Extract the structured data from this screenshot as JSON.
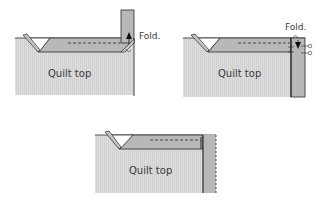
{
  "colors": {
    "quilt": "#d9d9d9",
    "binding": "#b8b8b8",
    "line": "#2a2a2a",
    "background": "#ffffff"
  },
  "panels": [
    {
      "id": "step1",
      "quilt_label": "Quilt top",
      "fold_label": "Fold.",
      "arrow": "up"
    },
    {
      "id": "step2",
      "quilt_label": "Quilt top",
      "fold_label": "Fold.",
      "arrow": "down"
    },
    {
      "id": "step3",
      "quilt_label": "Quilt top"
    }
  ]
}
